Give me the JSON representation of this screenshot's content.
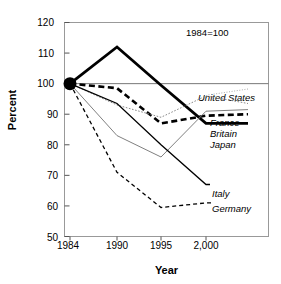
{
  "chart_data": {
    "type": "line",
    "title": "",
    "subtitle": "",
    "annotation": "1984=100",
    "xlabel": "Year",
    "ylabel": "Percent",
    "categories": [
      "1984",
      "1990",
      "1995",
      "2,000"
    ],
    "xticklabels": [
      "1984",
      "1990",
      "1995",
      "2,000"
    ],
    "yticklabels": [
      "50",
      "60",
      "70",
      "80",
      "90",
      "100",
      "110",
      "120"
    ],
    "ytickvalues": [
      50,
      60,
      70,
      80,
      90,
      100,
      110,
      120
    ],
    "ylim": [
      50,
      120
    ],
    "grid": false,
    "reference_line": 100,
    "legend_position": "inline-right",
    "origin_marker": {
      "x": "1984",
      "y": 100,
      "style": "filled-circle"
    },
    "series": [
      {
        "name": "Japan",
        "values": [
          100,
          112,
          99.5,
          87
        ],
        "style": "thick solid black",
        "label": "Japan"
      },
      {
        "name": "Britain",
        "values": [
          100,
          98.5,
          87,
          89.5
        ],
        "style": "thick dashed black",
        "label": "Britain"
      },
      {
        "name": "United States",
        "values": [
          100,
          93,
          89,
          96
        ],
        "style": "fine dotted gray",
        "label": "United States"
      },
      {
        "name": "France",
        "values": [
          100,
          83,
          76,
          91
        ],
        "style": "thin solid gray",
        "label": "France"
      },
      {
        "name": "Italy",
        "values": [
          100,
          93.5,
          80,
          67
        ],
        "style": "thin solid black",
        "label": "Italy"
      },
      {
        "name": "Germany",
        "values": [
          100,
          71,
          59.5,
          61
        ],
        "style": "thin dashed black",
        "label": "Germany"
      }
    ]
  },
  "labels": {
    "united_states": "United States",
    "france": "France",
    "britain": "Britain",
    "japan": "Japan",
    "italy": "Italy",
    "germany": "Germany"
  },
  "axis": {
    "y_title": "Percent",
    "x_title": "Year",
    "y_0": "50",
    "y_1": "60",
    "y_2": "70",
    "y_3": "80",
    "y_4": "90",
    "y_5": "100",
    "y_6": "110",
    "y_7": "120",
    "x_0": "1984",
    "x_1": "1990",
    "x_2": "1995",
    "x_3": "2,000"
  },
  "note": "1984=100",
  "colors": {
    "frame": "#999999",
    "series_black": "#000000",
    "series_gray": "#777777",
    "background": "#ffffff"
  }
}
